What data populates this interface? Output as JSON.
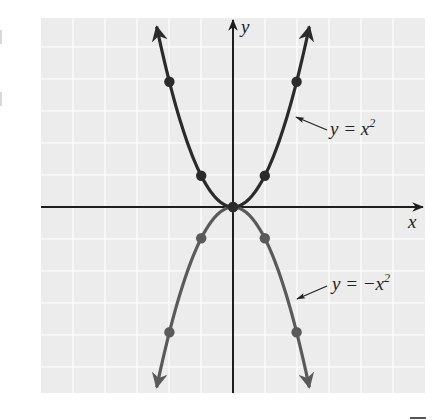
{
  "chart_data": {
    "type": "line",
    "title": "",
    "xlabel": "x",
    "ylabel": "y",
    "xlim": [
      -6,
      6
    ],
    "ylim": [
      -6,
      6
    ],
    "grid": true,
    "legend_position": "inline annotations",
    "tick_labels": false,
    "series": [
      {
        "name": "y = x^2",
        "label": "y = x",
        "label_sup": "2",
        "color": "#2b2b2b",
        "points": [
          [
            -2,
            4
          ],
          [
            -1,
            1
          ],
          [
            0,
            0
          ],
          [
            1,
            1
          ],
          [
            2,
            4
          ]
        ],
        "domain": [
          -2.4,
          2.4
        ]
      },
      {
        "name": "y = -x^2",
        "label": "y = −x",
        "label_sup": "2",
        "color": "#5a5a5a",
        "points": [
          [
            -2,
            -4
          ],
          [
            -1,
            -1
          ],
          [
            0,
            0
          ],
          [
            1,
            -1
          ],
          [
            2,
            -4
          ]
        ],
        "domain": [
          -2.4,
          2.4
        ]
      }
    ]
  },
  "labels": {
    "x_axis": "x",
    "y_axis": "y",
    "upper_curve": "y = x",
    "upper_sup": "2",
    "lower_curve": "y = −x",
    "lower_sup": "2"
  },
  "colors": {
    "grid_bg": "#ececec",
    "grid_line": "#fafafa",
    "axis": "#1e1e1e",
    "upper_curve": "#2b2b2b",
    "lower_curve": "#5a5a5a"
  }
}
